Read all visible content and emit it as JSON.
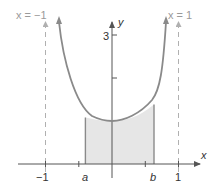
{
  "figure": {
    "type": "function-graph",
    "function": "y = cosh(x)",
    "axes": {
      "x_label": "x",
      "y_label": "y",
      "x_ticks": [
        {
          "value": -1,
          "label": "−1"
        },
        {
          "value": -0.5,
          "label": ""
        },
        {
          "value": 0.5,
          "label": ""
        },
        {
          "value": 1,
          "label": "1"
        }
      ],
      "y_ticks": [
        {
          "value": 2,
          "label": ""
        },
        {
          "value": 3,
          "label": "3"
        }
      ]
    },
    "asymptotes": [
      {
        "x": -1,
        "label": "x = −1"
      },
      {
        "x": 1,
        "label": "x = 1"
      }
    ],
    "shaded_region": {
      "from_label": "a",
      "to_label": "b",
      "a_value": -0.4,
      "b_value": 0.7
    },
    "colors": {
      "curve": "#8a8a8a",
      "shade": "#e6e6e6",
      "asymptote": "#b0b0b0",
      "axis": "#555555"
    }
  }
}
